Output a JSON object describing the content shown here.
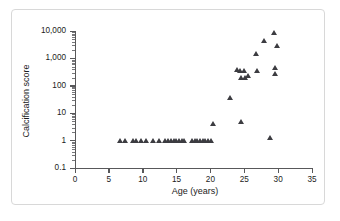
{
  "chart_data": {
    "type": "scatter",
    "title": "",
    "xlabel": "Age (years)",
    "ylabel": "Calcification score",
    "xlim": [
      0,
      35
    ],
    "ylim": [
      0.1,
      10000
    ],
    "yscale": "log",
    "xscale": "linear",
    "grid": false,
    "legend": null,
    "marker": "triangle",
    "marker_color": "#3c3c41",
    "xticks": [
      "0",
      "5",
      "10",
      "15",
      "20",
      "25",
      "30",
      "35"
    ],
    "xtick_values": [
      0,
      5,
      10,
      15,
      20,
      25,
      30,
      35
    ],
    "yticks": [
      "0.1",
      "1",
      "10",
      "100",
      "1,000",
      "10,000"
    ],
    "ytick_values": [
      0.1,
      1,
      10,
      100,
      1000,
      10000
    ],
    "points": [
      {
        "x": 6.7,
        "y": 1
      },
      {
        "x": 7.5,
        "y": 1
      },
      {
        "x": 8.6,
        "y": 1
      },
      {
        "x": 9.0,
        "y": 1
      },
      {
        "x": 9.8,
        "y": 1
      },
      {
        "x": 10.6,
        "y": 1
      },
      {
        "x": 11.6,
        "y": 1
      },
      {
        "x": 12.4,
        "y": 1
      },
      {
        "x": 13.3,
        "y": 1
      },
      {
        "x": 13.8,
        "y": 1
      },
      {
        "x": 14.2,
        "y": 1
      },
      {
        "x": 14.6,
        "y": 1
      },
      {
        "x": 15.0,
        "y": 1
      },
      {
        "x": 15.4,
        "y": 1
      },
      {
        "x": 15.8,
        "y": 1
      },
      {
        "x": 16.2,
        "y": 1
      },
      {
        "x": 17.3,
        "y": 1
      },
      {
        "x": 17.7,
        "y": 1
      },
      {
        "x": 18.1,
        "y": 1
      },
      {
        "x": 18.5,
        "y": 1
      },
      {
        "x": 18.9,
        "y": 1
      },
      {
        "x": 19.3,
        "y": 1
      },
      {
        "x": 19.7,
        "y": 1
      },
      {
        "x": 20.1,
        "y": 1
      },
      {
        "x": 20.4,
        "y": 4
      },
      {
        "x": 23.0,
        "y": 35
      },
      {
        "x": 24.0,
        "y": 370
      },
      {
        "x": 24.4,
        "y": 360
      },
      {
        "x": 24.6,
        "y": 190
      },
      {
        "x": 24.6,
        "y": 5
      },
      {
        "x": 25.0,
        "y": 360
      },
      {
        "x": 25.2,
        "y": 200
      },
      {
        "x": 25.6,
        "y": 230
      },
      {
        "x": 26.8,
        "y": 1500
      },
      {
        "x": 26.9,
        "y": 350
      },
      {
        "x": 28.0,
        "y": 4300
      },
      {
        "x": 28.9,
        "y": 1.3
      },
      {
        "x": 29.4,
        "y": 8500
      },
      {
        "x": 29.6,
        "y": 460
      },
      {
        "x": 29.6,
        "y": 270
      },
      {
        "x": 29.9,
        "y": 2900
      }
    ]
  },
  "figure": {
    "frame_color": "#d8d8d8",
    "axis_color": "#58585a",
    "background": "#ffffff"
  }
}
